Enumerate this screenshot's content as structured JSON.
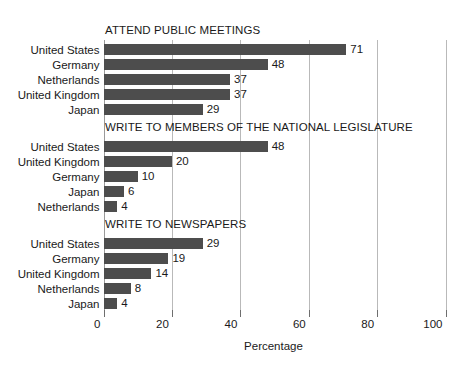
{
  "chart_data": {
    "type": "bar",
    "title": "",
    "xlabel": "Percentage",
    "ylabel": "",
    "xlim": [
      0,
      100
    ],
    "xticks": [
      0,
      20,
      40,
      60,
      80,
      100
    ],
    "xtick_labels": [
      "0",
      "20",
      "40",
      "60",
      "80",
      "100"
    ],
    "grid": true,
    "legend": "none",
    "orientation": "horizontal",
    "bar_color": "#4d4d4d",
    "panels": [
      {
        "title": "ATTEND PUBLIC MEETINGS",
        "categories": [
          "United States",
          "Germany",
          "Netherlands",
          "United Kingdom",
          "Japan"
        ],
        "values": [
          71,
          48,
          37,
          37,
          29
        ]
      },
      {
        "title": "WRITE TO MEMBERS OF THE NATIONAL LEGISLATURE",
        "categories": [
          "United States",
          "United Kingdom",
          "Germany",
          "Japan",
          "Netherlands"
        ],
        "values": [
          48,
          20,
          10,
          6,
          4
        ]
      },
      {
        "title": "WRITE TO NEWSPAPERS",
        "categories": [
          "United States",
          "Germany",
          "United Kingdom",
          "Netherlands",
          "Japan"
        ],
        "values": [
          29,
          19,
          14,
          8,
          4
        ]
      }
    ]
  }
}
